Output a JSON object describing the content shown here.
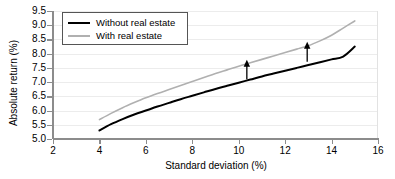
{
  "chart_data": {
    "type": "line",
    "title": "",
    "xlabel": "Standard deviation (%)",
    "ylabel": "Absolute return (%)",
    "xlim": [
      2,
      16
    ],
    "ylim": [
      5.0,
      9.5
    ],
    "xticks": [
      "2",
      "4",
      "6",
      "8",
      "10",
      "12",
      "14",
      "16"
    ],
    "xtick_values": [
      2,
      4,
      6,
      8,
      10,
      12,
      14,
      16
    ],
    "yticks": [
      "5.0",
      "5.5",
      "6.0",
      "6.5",
      "7.0",
      "7.5",
      "8.0",
      "8.5",
      "9.0",
      "9.5"
    ],
    "ytick_values": [
      5.0,
      5.5,
      6.0,
      6.5,
      7.0,
      7.5,
      8.0,
      8.5,
      9.0,
      9.5
    ],
    "grid": true,
    "legend_position": "upper-left",
    "series": [
      {
        "name": "Without real estate",
        "color": "#000000",
        "x": [
          4.0,
          4.5,
          5.0,
          5.5,
          6.0,
          6.5,
          7.0,
          7.5,
          8.0,
          8.5,
          9.0,
          9.5,
          10.0,
          10.5,
          11.0,
          11.5,
          12.0,
          12.5,
          13.0,
          13.5,
          14.0,
          14.5,
          15.0
        ],
        "y": [
          5.3,
          5.52,
          5.7,
          5.86,
          6.0,
          6.14,
          6.27,
          6.4,
          6.52,
          6.64,
          6.76,
          6.87,
          6.98,
          7.09,
          7.2,
          7.3,
          7.4,
          7.5,
          7.6,
          7.7,
          7.8,
          7.9,
          8.25
        ]
      },
      {
        "name": "With real estate",
        "color": "#b0b0b0",
        "x": [
          4.0,
          4.5,
          5.0,
          5.5,
          6.0,
          6.5,
          7.0,
          7.5,
          8.0,
          8.5,
          9.0,
          9.5,
          10.0,
          10.5,
          11.0,
          11.5,
          12.0,
          12.5,
          13.0,
          13.5,
          14.0,
          14.5,
          15.0
        ],
        "y": [
          5.68,
          5.9,
          6.1,
          6.28,
          6.45,
          6.6,
          6.74,
          6.88,
          7.02,
          7.16,
          7.3,
          7.43,
          7.56,
          7.68,
          7.8,
          7.92,
          8.04,
          8.16,
          8.28,
          8.45,
          8.65,
          8.9,
          9.15
        ]
      }
    ],
    "annotations": [
      {
        "name": "gain-arrow-left",
        "x": 10.35,
        "y_from": 7.1,
        "y_to": 7.75,
        "color": "#000000"
      },
      {
        "name": "gain-arrow-right",
        "x": 12.95,
        "y_from": 7.72,
        "y_to": 8.38,
        "color": "#000000"
      }
    ]
  },
  "legend": {
    "entries": [
      {
        "label": "Without real estate",
        "color": "#000000"
      },
      {
        "label": "With real estate",
        "color": "#b0b0b0"
      }
    ]
  },
  "colors": {
    "without_real_estate": "#000000",
    "with_real_estate": "#b0b0b0",
    "gridline": "#ececec",
    "axis": "#8c8c8c",
    "background": "#ffffff"
  }
}
